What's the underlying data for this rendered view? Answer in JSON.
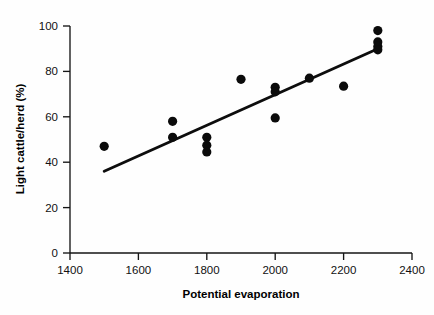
{
  "chart_data": {
    "type": "scatter",
    "title": "",
    "xlabel": "Potential evaporation",
    "ylabel": "Light cattle/herd (%)",
    "xlim": [
      1400,
      2400
    ],
    "ylim": [
      0,
      100
    ],
    "xticks": [
      1400,
      1600,
      1800,
      2000,
      2200,
      2400
    ],
    "yticks": [
      0,
      20,
      40,
      60,
      80,
      100
    ],
    "grid": false,
    "legend": null,
    "marker": "filled-circle",
    "marker_color": "#0b0b0b",
    "points": [
      {
        "x": 1500,
        "y": 47.0
      },
      {
        "x": 1700,
        "y": 58.0
      },
      {
        "x": 1700,
        "y": 51.0
      },
      {
        "x": 1800,
        "y": 51.0
      },
      {
        "x": 1800,
        "y": 47.5
      },
      {
        "x": 1800,
        "y": 44.5
      },
      {
        "x": 1900,
        "y": 76.5
      },
      {
        "x": 2000,
        "y": 73.0
      },
      {
        "x": 2000,
        "y": 71.0
      },
      {
        "x": 2000,
        "y": 59.5
      },
      {
        "x": 2100,
        "y": 77.0
      },
      {
        "x": 2200,
        "y": 73.5
      },
      {
        "x": 2300,
        "y": 98.0
      },
      {
        "x": 2300,
        "y": 93.0
      },
      {
        "x": 2300,
        "y": 91.0
      },
      {
        "x": 2300,
        "y": 89.5
      }
    ],
    "series": [
      {
        "name": "observations",
        "x": [
          1500,
          1700,
          1700,
          1800,
          1800,
          1800,
          1900,
          2000,
          2000,
          2000,
          2100,
          2200,
          2300,
          2300,
          2300,
          2300
        ],
        "values": [
          47.0,
          58.0,
          51.0,
          51.0,
          47.5,
          44.5,
          76.5,
          73.0,
          71.0,
          59.5,
          77.0,
          73.5,
          98.0,
          93.0,
          91.0,
          89.5
        ]
      }
    ],
    "trendline": {
      "type": "linear-fit",
      "color": "#0d0d0d",
      "x_start": 1500,
      "y_start": 36.0,
      "x_end": 2300,
      "y_end": 90.0
    }
  },
  "axes": {
    "x_tick_labels": [
      "1400",
      "1600",
      "1800",
      "2000",
      "2200",
      "2400"
    ],
    "y_tick_labels": [
      "0",
      "20",
      "40",
      "60",
      "80",
      "100"
    ],
    "x_axis_title": "Potential evaporation",
    "y_axis_title": "Light cattle/herd (%)"
  }
}
